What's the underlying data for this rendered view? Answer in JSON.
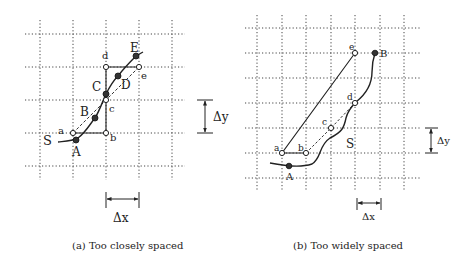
{
  "figure": {
    "panel_a": {
      "caption": "(a) Too closely spaced",
      "grid": {
        "x": [
          40,
          73,
          106,
          139,
          172
        ],
        "y": [
          34,
          67,
          100,
          133,
          166
        ],
        "x_extent": [
          25,
          185
        ],
        "y_extent": [
          20,
          180
        ]
      },
      "curve_label": "S",
      "filled_points": [
        {
          "label": "A",
          "x": 76,
          "y": 140
        },
        {
          "label": "B",
          "x": 95,
          "y": 118
        },
        {
          "label": "C",
          "x": 106,
          "y": 94
        },
        {
          "label": "D",
          "x": 118,
          "y": 76
        },
        {
          "label": "E",
          "x": 136,
          "y": 56
        }
      ],
      "open_points": [
        {
          "label": "a",
          "x": 73,
          "y": 133
        },
        {
          "label": "b",
          "x": 106,
          "y": 133
        },
        {
          "label": "c",
          "x": 106,
          "y": 100
        },
        {
          "label": "d",
          "x": 106,
          "y": 67
        },
        {
          "label": "e",
          "x": 139,
          "y": 67
        }
      ],
      "delta_x_label": "Δx",
      "delta_y_label": "Δy"
    },
    "panel_b": {
      "caption": "(b) Too widely spaced",
      "grid": {
        "x": [
          257,
          282,
          306,
          331,
          355,
          380,
          404
        ],
        "y": [
          28,
          53,
          78,
          103,
          128,
          153,
          178
        ],
        "x_extent": [
          245,
          420
        ],
        "y_extent": [
          15,
          190
        ]
      },
      "curve_label": "S",
      "filled_points": [
        {
          "label": "A",
          "x": 289,
          "y": 166
        },
        {
          "label": "B",
          "x": 375,
          "y": 53
        }
      ],
      "open_points": [
        {
          "label": "a",
          "x": 282,
          "y": 153
        },
        {
          "label": "b",
          "x": 306,
          "y": 153
        },
        {
          "label": "c",
          "x": 331,
          "y": 128
        },
        {
          "label": "d",
          "x": 355,
          "y": 103
        },
        {
          "label": "e",
          "x": 355,
          "y": 53
        }
      ],
      "delta_x_label": "Δx",
      "delta_y_label": "Δy"
    }
  }
}
